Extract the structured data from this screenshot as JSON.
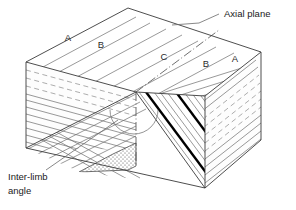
{
  "figure": {
    "kind": "geological-block-diagram",
    "background_color": "#ffffff",
    "line_color": "#3a3a3a",
    "bed_color": "#6d6d6d",
    "marker_bed_color": "#000000"
  },
  "annotations": {
    "axial_plane": {
      "label": "Axial plane",
      "leader": "line from text to fold hinge on top surface"
    },
    "inter_limb_angle": {
      "label_line1": "Inter-limb",
      "label_line2": "angle",
      "leader": "line from text up to arc between fold limbs"
    }
  },
  "top_surface_units": [
    {
      "label": "A",
      "x": 68,
      "y": 41
    },
    {
      "label": "B",
      "x": 101,
      "y": 48
    },
    {
      "label": "C",
      "x": 164,
      "y": 60
    },
    {
      "label": "B",
      "x": 206,
      "y": 67
    },
    {
      "label": "A",
      "x": 235,
      "y": 62
    }
  ],
  "structures": {
    "fold_type": "anticline",
    "axial_trace_style": "dash-dot",
    "marker_bed_count": 2,
    "core_unit_ornament": "stipple"
  }
}
